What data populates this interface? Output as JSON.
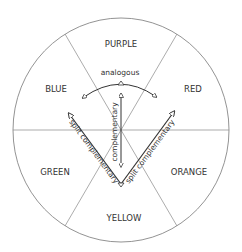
{
  "diagram": {
    "segments": [
      {
        "label": "PURPLE"
      },
      {
        "label": "RED"
      },
      {
        "label": "ORANGE"
      },
      {
        "label": "YELLOW"
      },
      {
        "label": "GREEN"
      },
      {
        "label": "BLUE"
      }
    ],
    "relations": {
      "analogous": "analogous",
      "complementary": "complementary",
      "split_left": "split complementary",
      "split_right": "split complementary"
    },
    "colors": {
      "line": "#555555",
      "text": "#333333",
      "background": "#ffffff"
    }
  }
}
